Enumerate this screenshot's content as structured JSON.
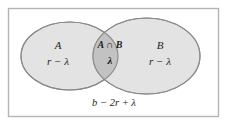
{
  "figure": {
    "type": "venn-diagram",
    "sets": 2,
    "frame": {
      "border_color": "#b4b4b4",
      "background": "#ffffff"
    },
    "colors": {
      "set_fill": "#e3e3e3",
      "intersection_fill": "#c2c2c2",
      "stroke": "#8a8a8a",
      "text": "#1d1d1d"
    },
    "regions": {
      "left_only": {
        "name": "A",
        "count": "r − λ"
      },
      "intersection": {
        "name": "A ∩ B",
        "count": "λ"
      },
      "right_only": {
        "name": "B",
        "count": "r − λ"
      },
      "outside": {
        "count": "b − 2r + λ"
      }
    }
  }
}
